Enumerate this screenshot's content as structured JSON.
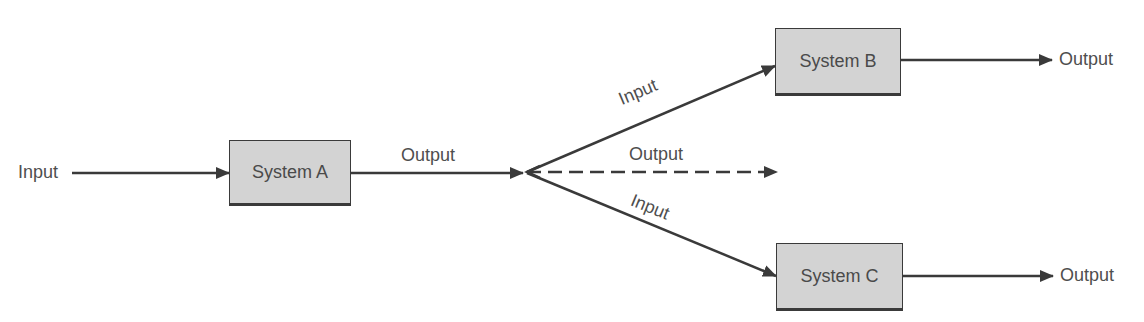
{
  "diagram": {
    "type": "flow",
    "colors": {
      "line": "#3a3a3a",
      "box_fill": "#d3d3d3",
      "text": "#4e4e4e"
    },
    "nodes": [
      {
        "id": "A",
        "label": "System A"
      },
      {
        "id": "B",
        "label": "System B"
      },
      {
        "id": "C",
        "label": "System C"
      }
    ],
    "labels": {
      "input_main": "Input",
      "output_a": "Output",
      "input_b": "Input",
      "output_dashed": "Output",
      "input_c": "Input",
      "output_b": "Output",
      "output_c": "Output"
    },
    "edges": [
      {
        "from": "Input",
        "to": "A",
        "style": "solid"
      },
      {
        "from": "A",
        "to": "branch",
        "label": "Output",
        "style": "solid"
      },
      {
        "from": "branch",
        "to": "B",
        "label": "Input",
        "style": "solid"
      },
      {
        "from": "branch",
        "to": "open",
        "label": "Output",
        "style": "dashed"
      },
      {
        "from": "branch",
        "to": "C",
        "label": "Input",
        "style": "solid"
      },
      {
        "from": "B",
        "to": "Output",
        "style": "solid"
      },
      {
        "from": "C",
        "to": "Output",
        "style": "solid"
      }
    ]
  }
}
